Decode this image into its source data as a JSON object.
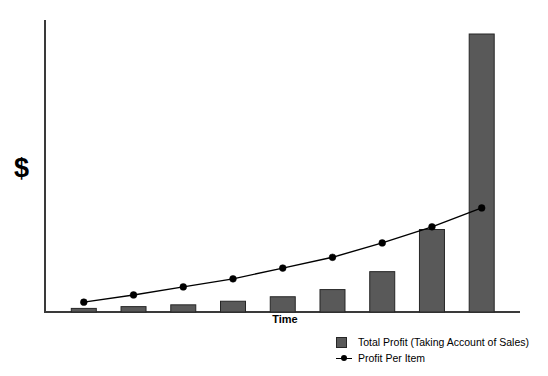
{
  "chart_data": {
    "type": "bar",
    "title": "",
    "subtitle": "",
    "xlabel": "Time",
    "ylabel": "$",
    "grid": false,
    "legend_position": "bottom-right",
    "categories": [
      "1",
      "2",
      "3",
      "4",
      "5",
      "6",
      "7",
      "8",
      "9"
    ],
    "axis": {
      "x_range_note": "unlabeled time axis, 9 evenly spaced periods",
      "y_range_note": "unlabeled dollar axis, no tick marks",
      "x_ticks": [],
      "y_ticks": []
    },
    "series": [
      {
        "name": "Total Profit (Taking Account of Sales)",
        "type": "bar",
        "color": "#595959",
        "values": [
          4,
          6,
          8,
          12,
          17,
          25,
          45,
          92,
          310
        ]
      },
      {
        "name": "Profit Per Item",
        "type": "line",
        "color": "#000000",
        "marker": "circle",
        "values": [
          11,
          19,
          28,
          37,
          49,
          61,
          77,
          95,
          116
        ]
      }
    ],
    "annotations": []
  },
  "labels": {
    "y_axis_title": "$",
    "x_axis_title": "Time"
  },
  "legend": {
    "items": [
      {
        "label": "Total Profit (Taking Account of Sales)",
        "marker": "filled-square",
        "color": "#595959"
      },
      {
        "label": "Profit Per Item",
        "marker": "line-with-dot",
        "color": "#000000"
      }
    ]
  },
  "colors": {
    "bar_fill": "#595959",
    "bar_stroke": "#262626",
    "line": "#000000",
    "axis": "#3a3a3a",
    "background": "#ffffff"
  }
}
